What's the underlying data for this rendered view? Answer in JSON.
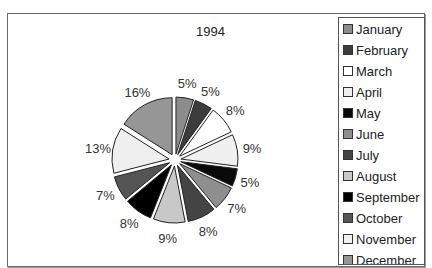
{
  "chart_data": {
    "type": "pie",
    "title": "1994",
    "categories": [
      "January",
      "February",
      "March",
      "April",
      "May",
      "June",
      "July",
      "August",
      "September",
      "October",
      "November",
      "December"
    ],
    "values": [
      5,
      5,
      8,
      9,
      5,
      7,
      8,
      9,
      8,
      7,
      13,
      16
    ],
    "labels": [
      "5%",
      "5%",
      "8%",
      "9%",
      "5%",
      "7%",
      "8%",
      "9%",
      "8%",
      "7%",
      "13%",
      "16%"
    ],
    "colors": [
      "#8c8c8c",
      "#3c3c3c",
      "#ffffff",
      "#f0f0f0",
      "#0a0a0a",
      "#8e8e8e",
      "#444444",
      "#c8c8c8",
      "#000000",
      "#555555",
      "#efefef",
      "#969696"
    ],
    "legend_position": "right",
    "exploded": true,
    "start_angle_deg": 0,
    "direction": "clockwise"
  },
  "legend": {
    "items": [
      "January",
      "February",
      "March",
      "April",
      "May",
      "June",
      "July",
      "August",
      "September",
      "October",
      "November",
      "December"
    ]
  }
}
